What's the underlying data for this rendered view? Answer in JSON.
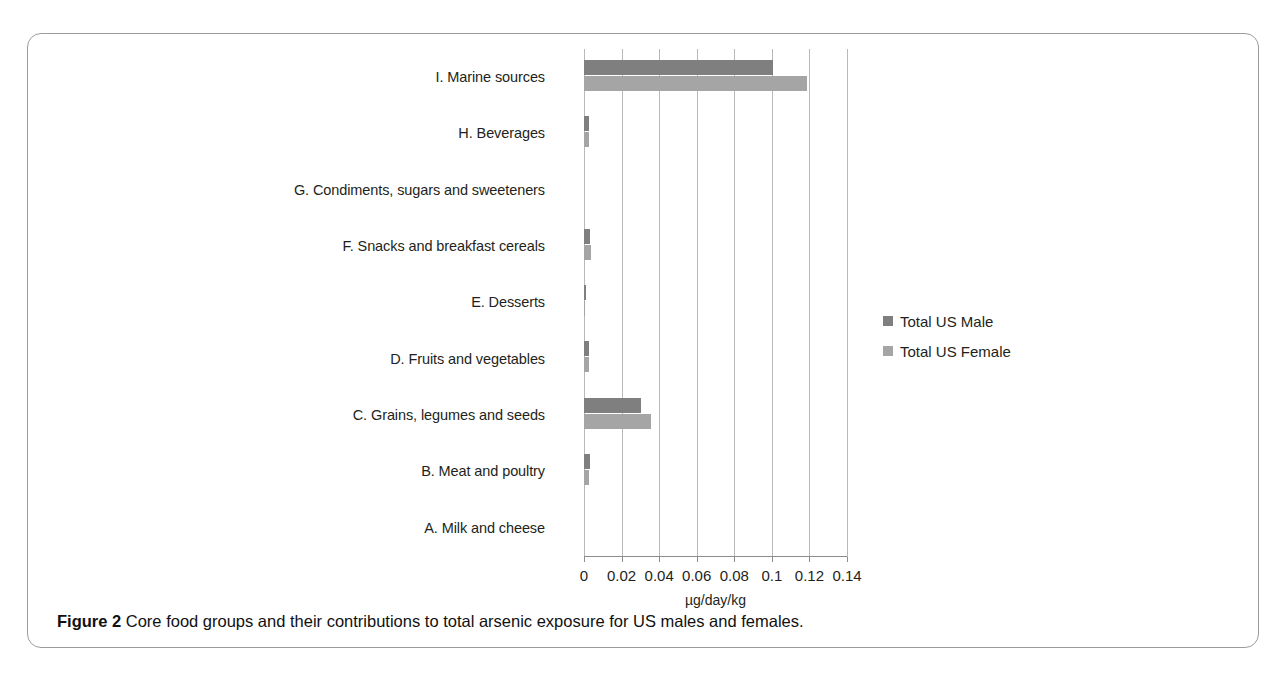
{
  "figure": {
    "caption_label": "Figure 2",
    "caption_text": "Core food groups and their contributions to total arsenic exposure for US males and females."
  },
  "legend": {
    "position": "right",
    "items": [
      {
        "label": "Total US Male",
        "color": "#7f7f7f"
      },
      {
        "label": "Total US Female",
        "color": "#a5a5a5"
      }
    ]
  },
  "chart_data": {
    "type": "bar",
    "orientation": "horizontal",
    "title": "",
    "xlabel": "µg/day/kg",
    "ylabel": "",
    "xlim": [
      0,
      0.14
    ],
    "xticks": [
      "0",
      "0.02",
      "0.04",
      "0.06",
      "0.08",
      "0.1",
      "0.12",
      "0.14"
    ],
    "xtick_values": [
      0,
      0.02,
      0.04,
      0.06,
      0.08,
      0.1,
      0.12,
      0.14
    ],
    "grid": "vertical",
    "categories": [
      "I. Marine sources",
      "H. Beverages",
      "G. Condiments, sugars and sweeteners",
      "F. Snacks and breakfast cereals",
      "E. Desserts",
      "D. Fruits and vegetables",
      "C. Grains, legumes and seeds",
      "B. Meat and poultry",
      "A. Milk and cheese"
    ],
    "series": [
      {
        "name": "Total US Male",
        "color": "#7f7f7f",
        "values": [
          0.1005,
          0.0028,
          0.0,
          0.0032,
          0.0008,
          0.0026,
          0.0305,
          0.003,
          0.0
        ]
      },
      {
        "name": "Total US Female",
        "color": "#a5a5a5",
        "values": [
          0.1185,
          0.0026,
          0.0,
          0.0035,
          0.0006,
          0.0024,
          0.0355,
          0.0026,
          0.0
        ]
      }
    ]
  }
}
